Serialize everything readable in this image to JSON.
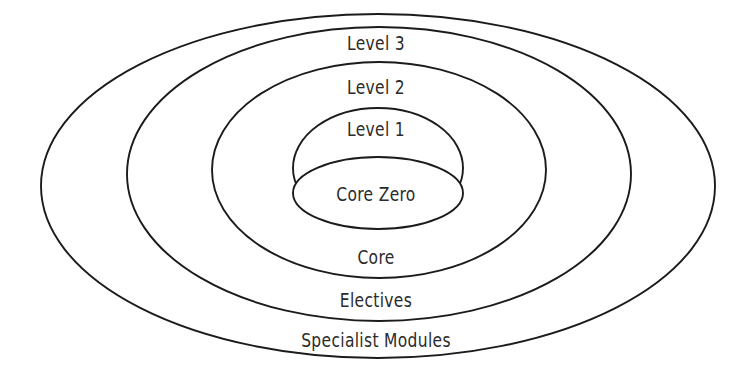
{
  "diagram": {
    "type": "concentric-ellipse-nested",
    "background_color": "#ffffff",
    "stroke_color": "#1b1b1b",
    "text_color": "#2b2b2b",
    "band_count": 6,
    "bands": [
      {
        "index": 0,
        "label": "Level 3",
        "ring": "outermost-upper-band",
        "label_x": 376,
        "label_y": 43
      },
      {
        "index": 1,
        "label": "Level 2",
        "ring": "second-upper-band",
        "label_x": 376,
        "label_y": 87
      },
      {
        "index": 2,
        "label": "Level 1",
        "ring": "third-upper-band",
        "label_x": 376,
        "label_y": 129
      },
      {
        "index": 3,
        "label": "Core Zero",
        "ring": "innermost-core",
        "label_x": 378,
        "label_y": 194
      },
      {
        "index": 4,
        "label": "Core",
        "ring": "third-lower-band",
        "label_x": 378,
        "label_y": 257
      },
      {
        "index": 5,
        "label": "Electives",
        "ring": "second-lower-band",
        "label_x": 376,
        "label_y": 300
      },
      {
        "index": 6,
        "label": "Specialist Modules",
        "ring": "outermost-lower-band",
        "label_x": 376,
        "label_y": 340
      }
    ],
    "ellipses": [
      {
        "name": "specialist-modules-ellipse",
        "cx": 378,
        "cy": 186,
        "rx": 337,
        "ry": 172
      },
      {
        "name": "electives-ellipse",
        "cx": 379,
        "cy": 174,
        "rx": 252,
        "ry": 147
      },
      {
        "name": "core-ellipse",
        "cx": 379,
        "cy": 170,
        "rx": 167,
        "ry": 108
      },
      {
        "name": "level-one-ellipse",
        "cx": 378,
        "cy": 168,
        "rx": 85,
        "ry": 60
      },
      {
        "name": "core-zero-ellipse",
        "cx": 378,
        "cy": 193,
        "rx": 85,
        "ry": 36
      }
    ]
  }
}
